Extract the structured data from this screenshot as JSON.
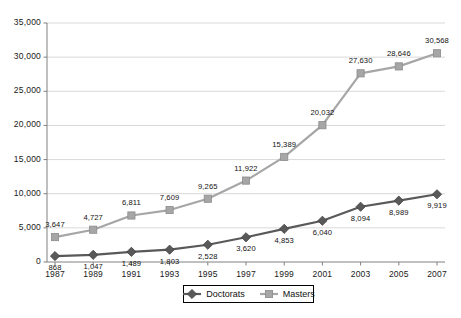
{
  "chart_data": {
    "type": "line",
    "title": "",
    "subtitle": "",
    "xlabel": "",
    "ylabel": "",
    "categories": [
      "1987",
      "1989",
      "1991",
      "1993",
      "1995",
      "1997",
      "1999",
      "2001",
      "2003",
      "2005",
      "2007"
    ],
    "x": [
      1987,
      1989,
      1991,
      1993,
      1995,
      1997,
      1999,
      2001,
      2003,
      2005,
      2007
    ],
    "series": [
      {
        "name": "Doctorats",
        "color": "#595959",
        "marker": "diamond",
        "values": [
          868,
          1047,
          1489,
          1803,
          2528,
          3620,
          4853,
          6040,
          8094,
          8989,
          9919
        ],
        "data_labels": [
          "868",
          "1,047",
          "1,489",
          "1,803",
          "2,528",
          "3,620",
          "4,853",
          "6,040",
          "8,094",
          "8,989",
          "9,919"
        ]
      },
      {
        "name": "Masters",
        "color": "#a6a6a6",
        "marker": "square",
        "values": [
          3647,
          4727,
          6811,
          7609,
          9265,
          11922,
          15389,
          20032,
          27630,
          28646,
          30568
        ],
        "data_labels": [
          "3,647",
          "4,727",
          "6,811",
          "7,609",
          "9,265",
          "11,922",
          "15,389",
          "20,032",
          "27,630",
          "28,646",
          "30,568"
        ]
      }
    ],
    "ylim": [
      0,
      35000
    ],
    "ytick_values": [
      0,
      5000,
      10000,
      15000,
      20000,
      25000,
      30000,
      35000
    ],
    "ytick_labels": [
      "0",
      "5,000",
      "10,000",
      "15,000",
      "20,000",
      "25,000",
      "30,000",
      "35,000"
    ],
    "grid": true,
    "grid_axis": "y",
    "grid_color": "#d9d9d9",
    "legend": {
      "position": "bottom",
      "entries": [
        {
          "label": "Doctorats",
          "color": "#595959",
          "marker": "diamond"
        },
        {
          "label": "Masters",
          "color": "#a6a6a6",
          "marker": "square"
        }
      ]
    },
    "background_color": "#ffffff",
    "axis_color": "#808080"
  }
}
